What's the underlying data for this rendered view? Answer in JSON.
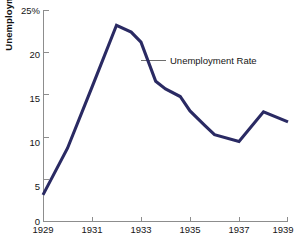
{
  "chart_data": {
    "type": "line",
    "title": "",
    "subtitle": "",
    "xlabel": "",
    "ylabel": "Unemployment rate",
    "xlim": [
      1929,
      1939
    ],
    "ylim": [
      0,
      25
    ],
    "grid": false,
    "legend_position": "none",
    "line_color": "#2a2a63",
    "x_ticks": [
      1929,
      1931,
      1933,
      1935,
      1937,
      1939
    ],
    "x_tick_labels": [
      "1929",
      "1931",
      "1933",
      "1935",
      "1937",
      "1939"
    ],
    "y_ticks": [
      0,
      5,
      10,
      15,
      20,
      25
    ],
    "y_tick_labels": [
      "0",
      "5",
      "10",
      "15",
      "20",
      "25%"
    ],
    "series": [
      {
        "name": "Unemployment Rate",
        "x": [
          1929,
          1930,
          1931,
          1932,
          1932.6,
          1933,
          1933.6,
          1934,
          1934.6,
          1935,
          1935.6,
          1936,
          1937,
          1938,
          1939
        ],
        "values": [
          3.2,
          8.7,
          15.9,
          23.2,
          22.4,
          21.2,
          16.6,
          15.7,
          14.8,
          13.1,
          11.4,
          10.3,
          9.5,
          13.0,
          11.8
        ]
      }
    ],
    "annotations": [
      {
        "text": "Unemployment Rate",
        "x": 1934.35,
        "y": 19.0,
        "leader_from_x": 1933.0,
        "leader_from_y": 19.0
      }
    ]
  }
}
